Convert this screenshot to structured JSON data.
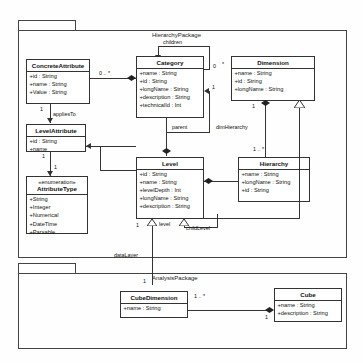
{
  "diagram": {
    "title_hierarchy_package": "HierarchyPackage",
    "title_analysis_package": "AnalysisPackage",
    "classes": {
      "concrete_attribute": {
        "name": "ConcreteAttribute",
        "attributes": [
          "+id : String",
          "+name : String",
          "+Value : String"
        ]
      },
      "category": {
        "name": "Category",
        "attributes": [
          "+name : String",
          "+id : String",
          "+longName : String",
          "+description : String",
          "+technicalId : Int"
        ]
      },
      "dimension": {
        "name": "Dimension",
        "attributes": [
          "+name : String",
          "+id : String",
          "+longName : String"
        ]
      },
      "level_attribute": {
        "name": "LevelAttribute",
        "attributes": [
          "+id : String",
          "+name"
        ]
      },
      "attribute_type": {
        "stereotype": "«enumeration»",
        "name": "AttributeType",
        "attributes": [
          "+String",
          "+Integer",
          "+Numerical",
          "+DateTime",
          "+Parsable"
        ]
      },
      "level": {
        "name": "Level",
        "attributes": [
          "+id : String",
          "+name : String",
          "+levelDepth : Int",
          "+longName : String",
          "+description : String"
        ]
      },
      "hierarchy": {
        "name": "Hierarchy",
        "attributes": [
          "+name : String",
          "+longName : String",
          "+id : String"
        ]
      },
      "cube_dimension": {
        "name": "CubeDimension",
        "attributes": [
          "+name : String"
        ]
      },
      "cube": {
        "name": "Cube",
        "attributes": [
          "+name : String",
          "+description : String"
        ]
      }
    },
    "roles": {
      "children": "children",
      "parent": "parent",
      "applies_to": "appliesTo",
      "dim_hierarchy": "dimHierarchy",
      "level": "level",
      "child_level": "childLevel",
      "data_layer": "dataLayer"
    },
    "multiplicities": {
      "concrete_attr_to_category": "0 .. *",
      "children_end": "0",
      "children_star": "*",
      "concrete_attr_one": "1",
      "level_attr_one": "1",
      "enum_one": "1",
      "category_parent_one": "1",
      "dimension_one": "1",
      "hierarchy_many": "1 .. *",
      "level_one": "1",
      "cube_dimension_one": "1",
      "cube_dimension_many": "1 .. *",
      "cube_one": "1",
      "level_to_cube_dim_one": "1"
    },
    "colors": {
      "line": "#333333",
      "class_fill": "#ffffff",
      "text": "#111111"
    }
  }
}
